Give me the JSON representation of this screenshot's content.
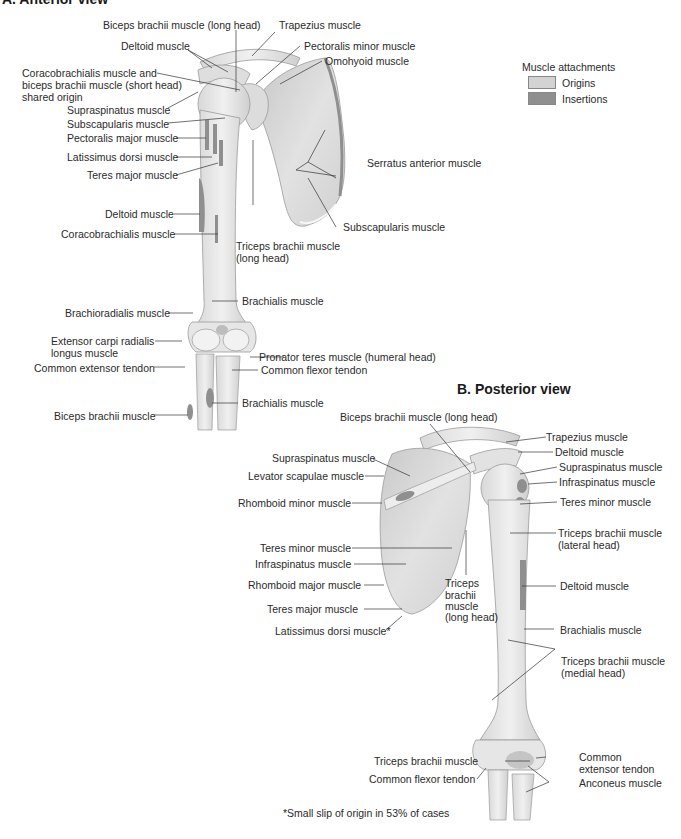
{
  "colors": {
    "bone": "#e6e6e6",
    "bone_shade": "#cfcfcf",
    "bone_outline": "#9a9a9a",
    "origin": "#d3d3d3",
    "insertion": "#8f8f8f",
    "leader": "#333333"
  },
  "anterior": {
    "title": "A. Anterior view",
    "labels": [
      "Biceps brachii muscle (long head)",
      "Trapezius muscle",
      "Deltoid muscle",
      "Pectoralis minor muscle",
      "Omohyoid muscle",
      "Coracobrachialis muscle and",
      "biceps brachii muscle (short head)",
      "shared origin",
      "Supraspinatus muscle",
      "Subscapularis muscle",
      "Pectoralis major muscle",
      "Latissimus dorsi muscle",
      "Teres major muscle",
      "Serratus anterior muscle",
      "Deltoid muscle",
      "Coracobrachialis muscle",
      "Subscapularis muscle",
      "Triceps brachii muscle",
      "(long head)",
      "Brachialis muscle",
      "Brachioradialis muscle",
      "Extensor carpi radialis",
      "longus muscle",
      "Pronator teres muscle (humeral head)",
      "Common extensor tendon",
      "Common flexor tendon",
      "Brachialis muscle",
      "Biceps brachii muscle"
    ]
  },
  "legend": {
    "title": "Muscle attachments",
    "items": [
      {
        "label": "Origins",
        "color": "#d3d3d3"
      },
      {
        "label": "Insertions",
        "color": "#8f8f8f"
      }
    ]
  },
  "posterior": {
    "title": "B. Posterior view",
    "labels": [
      "Biceps brachii muscle (long head)",
      "Trapezius muscle",
      "Deltoid muscle",
      "Supraspinatus muscle",
      "Supraspinatus muscle",
      "Infraspinatus muscle",
      "Levator scapulae muscle",
      "Rhomboid minor muscle",
      "Teres minor muscle",
      "Triceps brachii muscle",
      "(lateral head)",
      "Teres minor muscle",
      "Infraspinatus muscle",
      "Deltoid muscle",
      "Rhomboid major muscle",
      "Triceps",
      "brachii",
      "muscle",
      "(long head)",
      "Teres major muscle",
      "Latissimus dorsi muscle*",
      "Brachialis muscle",
      "Triceps brachii muscle",
      "(medial head)",
      "Triceps brachii muscle",
      "Common",
      "extensor tendon",
      "Common flexor tendon",
      "Anconeus muscle"
    ]
  },
  "footnote": "*Small slip of origin in 53% of cases"
}
